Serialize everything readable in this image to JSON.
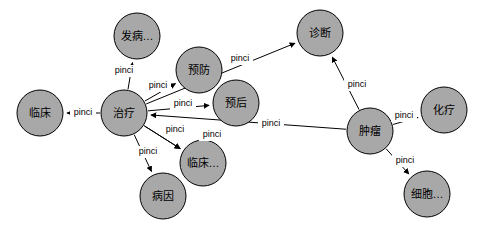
{
  "graph": {
    "nodes": [
      {
        "id": "linchuang",
        "label": "临床",
        "cx": 40,
        "cy": 113,
        "r": 23
      },
      {
        "id": "zhiliao",
        "label": "治疗",
        "cx": 124,
        "cy": 113,
        "r": 23
      },
      {
        "id": "fabing",
        "label": "发病…",
        "cx": 137,
        "cy": 36,
        "r": 23
      },
      {
        "id": "yufang",
        "label": "预防",
        "cx": 199,
        "cy": 70,
        "r": 23
      },
      {
        "id": "yuhou",
        "label": "预后",
        "cx": 236,
        "cy": 103,
        "r": 23
      },
      {
        "id": "zhenduan",
        "label": "诊断",
        "cx": 320,
        "cy": 33,
        "r": 23
      },
      {
        "id": "zhongliu",
        "label": "肿瘤",
        "cx": 370,
        "cy": 131,
        "r": 23
      },
      {
        "id": "huallao",
        "label": "化疗",
        "cx": 444,
        "cy": 110,
        "r": 23
      },
      {
        "id": "xibao",
        "label": "细胞…",
        "cx": 427,
        "cy": 194,
        "r": 23
      },
      {
        "id": "linchuang2",
        "label": "临床…",
        "cx": 203,
        "cy": 163,
        "r": 23
      },
      {
        "id": "bingyin",
        "label": "病因",
        "cx": 163,
        "cy": 196,
        "r": 23
      }
    ],
    "edges": [
      {
        "id": "e1",
        "from": "zhiliao",
        "to": "linchuang",
        "label": "pinci",
        "lx": 83,
        "ly": 113
      },
      {
        "id": "e2",
        "from": "zhiliao",
        "to": "fabing",
        "label": "pinci",
        "lx": 124,
        "ly": 71
      },
      {
        "id": "e3",
        "from": "zhiliao",
        "to": "yufang",
        "label": "pinci",
        "lx": 158,
        "ly": 86
      },
      {
        "id": "e4",
        "from": "zhiliao",
        "to": "yuhou",
        "label": "pinci",
        "lx": 183,
        "ly": 104
      },
      {
        "id": "e5",
        "from": "zhiliao",
        "to": "zhenduan",
        "label": "pinci",
        "lx": 240,
        "ly": 59
      },
      {
        "id": "e6",
        "from": "zhiliao",
        "to": "linchuang2",
        "label": "pinci",
        "lx": 175,
        "ly": 130
      },
      {
        "id": "e7",
        "from": "zhiliao",
        "to": "linchuang2",
        "label": "pinci",
        "lx": 212,
        "ly": 135
      },
      {
        "id": "e8",
        "from": "zhiliao",
        "to": "bingyin",
        "label": "pinci",
        "lx": 148,
        "ly": 152
      },
      {
        "id": "e9",
        "from": "zhongliu",
        "to": "zhiliao",
        "label": "pinci",
        "lx": 271,
        "ly": 124
      },
      {
        "id": "e10",
        "from": "zhongliu",
        "to": "zhenduan",
        "label": "pinci",
        "lx": 357,
        "ly": 85
      },
      {
        "id": "e11",
        "from": "zhongliu",
        "to": "huallao",
        "label": "pinci",
        "lx": 404,
        "ly": 116
      },
      {
        "id": "e12",
        "from": "zhongliu",
        "to": "xibao",
        "label": "pinci",
        "lx": 405,
        "ly": 161
      }
    ]
  }
}
